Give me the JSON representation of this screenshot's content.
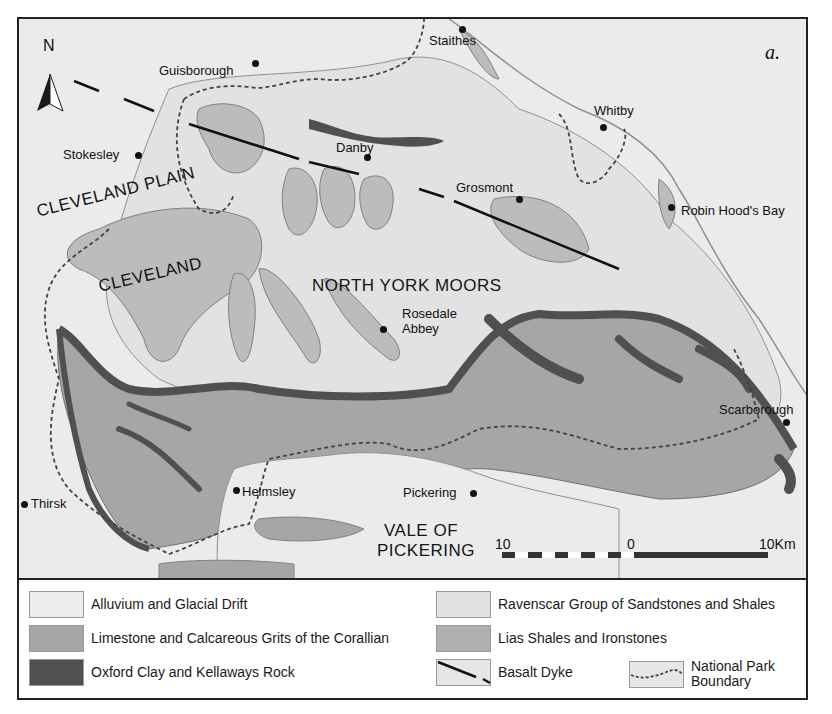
{
  "figure": {
    "panel_label": "a.",
    "north_label": "N",
    "colors": {
      "alluvium": "#ebebeb",
      "limestone": "#a6a6a6",
      "oxford_clay": "#505050",
      "ravenscar": "#e2e2e2",
      "lias": "#bcbcbc",
      "outline": "#808080",
      "dyke": "#111111",
      "boundary": "#444444"
    }
  },
  "map": {
    "regions": [
      {
        "label": "CLEVELAND PLAIN"
      },
      {
        "label": "CLEVELAND"
      },
      {
        "label": "NORTH YORK MOORS"
      },
      {
        "label": "VALE OF"
      },
      {
        "label": "PICKERING"
      }
    ],
    "places": [
      {
        "name": "Staithes"
      },
      {
        "name": "Guisborough"
      },
      {
        "name": "Whitby"
      },
      {
        "name": "Stokesley"
      },
      {
        "name": "Danby"
      },
      {
        "name": "Grosmont"
      },
      {
        "name": "Robin Hood's Bay"
      },
      {
        "name": "Rosedale"
      },
      {
        "name": "Abbey"
      },
      {
        "name": "Scarborough"
      },
      {
        "name": "Helmsley"
      },
      {
        "name": "Pickering"
      },
      {
        "name": "Thirsk"
      }
    ],
    "scale_bar": {
      "left_label": "10",
      "mid_label": "0",
      "right_label": "10Km"
    }
  },
  "legend": {
    "items": [
      {
        "label": "Alluvium and Glacial Drift"
      },
      {
        "label": "Limestone and Calcareous Grits of the Corallian"
      },
      {
        "label": "Oxford Clay and Kellaways Rock"
      },
      {
        "label": "Ravenscar Group of Sandstones and Shales"
      },
      {
        "label": "Lias Shales and Ironstones"
      },
      {
        "label": "Basalt Dyke"
      },
      {
        "label": "National Park"
      },
      {
        "label": "Boundary"
      }
    ]
  }
}
